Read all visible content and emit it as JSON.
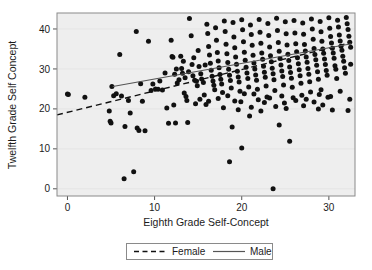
{
  "chart_data": {
    "type": "scatter",
    "title": "",
    "xlabel": "Eighth Grade Self-Concept",
    "ylabel": "Twelfth Grade Self Concept",
    "xlim": [
      -1.2,
      33.0
    ],
    "ylim": [
      -1.8,
      44.0
    ],
    "xticks": [
      0,
      10,
      20,
      30
    ],
    "yticks": [
      0,
      10,
      20,
      30,
      40
    ],
    "xtick_labels": [
      "0",
      "10",
      "20",
      "30"
    ],
    "ytick_labels": [
      "0",
      "10",
      "20",
      "30",
      "40"
    ],
    "grid": true,
    "legend_position": "below-axis-center",
    "marker": "filled-circle",
    "marker_color": "#111111",
    "plot_background": "#eeeeee",
    "legend": [
      {
        "name": "Female",
        "style": "dashed",
        "color": "#111111"
      },
      {
        "name": "Male",
        "style": "solid",
        "color": "#555555"
      }
    ],
    "series": [
      {
        "name": "Female",
        "type": "line",
        "style": "dashed",
        "x": [
          -1.2,
          32.6
        ],
        "y": [
          18.5,
          36.6
        ],
        "slope": 0.536,
        "intercept": 19.14
      },
      {
        "name": "Male",
        "type": "line",
        "style": "solid",
        "x": [
          5.2,
          32.6
        ],
        "y": [
          25.6,
          36.3
        ],
        "slope": 0.39,
        "intercept": 23.57
      }
    ],
    "points": [
      [
        0.0,
        23.7
      ],
      [
        0.1,
        23.6
      ],
      [
        2.0,
        22.9
      ],
      [
        4.8,
        19.5
      ],
      [
        4.9,
        16.9
      ],
      [
        5.0,
        16.5
      ],
      [
        5.1,
        25.6
      ],
      [
        5.3,
        23.3
      ],
      [
        5.6,
        23.8
      ],
      [
        6.0,
        33.6
      ],
      [
        6.2,
        23.2
      ],
      [
        6.5,
        2.5
      ],
      [
        6.6,
        15.6
      ],
      [
        7.0,
        22.1
      ],
      [
        7.2,
        19.0
      ],
      [
        7.6,
        4.3
      ],
      [
        7.9,
        39.4
      ],
      [
        8.0,
        15.2
      ],
      [
        8.2,
        14.6
      ],
      [
        8.4,
        26.3
      ],
      [
        8.6,
        21.9
      ],
      [
        8.9,
        14.5
      ],
      [
        9.3,
        36.9
      ],
      [
        9.6,
        24.6
      ],
      [
        9.8,
        26.2
      ],
      [
        10.1,
        25.0
      ],
      [
        10.4,
        24.9
      ],
      [
        10.6,
        27.0
      ],
      [
        10.9,
        24.7
      ],
      [
        11.2,
        29.0
      ],
      [
        11.4,
        20.2
      ],
      [
        11.6,
        16.4
      ],
      [
        11.9,
        37.2
      ],
      [
        12.0,
        33.1
      ],
      [
        12.1,
        32.9
      ],
      [
        12.2,
        21.0
      ],
      [
        12.3,
        28.7
      ],
      [
        12.4,
        16.5
      ],
      [
        12.6,
        26.5
      ],
      [
        12.8,
        27.3
      ],
      [
        13.0,
        33.2
      ],
      [
        13.1,
        30.1
      ],
      [
        13.2,
        28.9
      ],
      [
        13.4,
        24.0
      ],
      [
        13.5,
        27.8
      ],
      [
        13.6,
        23.1
      ],
      [
        13.8,
        16.6
      ],
      [
        13.9,
        29.3
      ],
      [
        14.0,
        42.6
      ],
      [
        14.2,
        38.3
      ],
      [
        14.3,
        31.1
      ],
      [
        14.4,
        28.3
      ],
      [
        14.6,
        27.2
      ],
      [
        14.8,
        26.9
      ],
      [
        14.9,
        25.8
      ],
      [
        15.0,
        34.6
      ],
      [
        15.1,
        30.6
      ],
      [
        15.3,
        28.8
      ],
      [
        15.4,
        27.5
      ],
      [
        15.6,
        26.6
      ],
      [
        15.7,
        23.5
      ],
      [
        15.9,
        21.1
      ],
      [
        16.0,
        41.2
      ],
      [
        16.1,
        38.9
      ],
      [
        16.2,
        35.6
      ],
      [
        16.3,
        33.5
      ],
      [
        16.4,
        31.4
      ],
      [
        16.5,
        29.7
      ],
      [
        16.6,
        28.2
      ],
      [
        16.7,
        27.0
      ],
      [
        16.8,
        25.9
      ],
      [
        16.9,
        24.8
      ],
      [
        17.0,
        40.3
      ],
      [
        17.1,
        37.2
      ],
      [
        17.2,
        34.1
      ],
      [
        17.3,
        32.0
      ],
      [
        17.4,
        30.3
      ],
      [
        17.5,
        28.6
      ],
      [
        17.6,
        27.4
      ],
      [
        17.7,
        26.2
      ],
      [
        17.8,
        24.1
      ],
      [
        17.9,
        20.3
      ],
      [
        18.0,
        42.0
      ],
      [
        18.1,
        39.4
      ],
      [
        18.2,
        36.2
      ],
      [
        18.3,
        33.8
      ],
      [
        18.4,
        31.6
      ],
      [
        18.5,
        29.9
      ],
      [
        18.6,
        28.4
      ],
      [
        18.7,
        27.1
      ],
      [
        18.8,
        25.2
      ],
      [
        18.9,
        15.5
      ],
      [
        18.6,
        6.8
      ],
      [
        19.0,
        41.6
      ],
      [
        19.1,
        38.0
      ],
      [
        19.2,
        35.3
      ],
      [
        19.3,
        33.0
      ],
      [
        19.4,
        31.2
      ],
      [
        19.5,
        29.4
      ],
      [
        19.6,
        28.0
      ],
      [
        19.7,
        26.7
      ],
      [
        19.8,
        24.4
      ],
      [
        19.9,
        21.8
      ],
      [
        20.0,
        42.3
      ],
      [
        20.1,
        39.8
      ],
      [
        20.2,
        36.8
      ],
      [
        20.3,
        34.2
      ],
      [
        20.4,
        32.2
      ],
      [
        20.5,
        30.4
      ],
      [
        20.6,
        29.0
      ],
      [
        20.7,
        27.6
      ],
      [
        20.8,
        25.5
      ],
      [
        20.9,
        18.2
      ],
      [
        20.0,
        10.2
      ],
      [
        21.0,
        41.0
      ],
      [
        21.1,
        38.6
      ],
      [
        21.2,
        35.9
      ],
      [
        21.3,
        33.4
      ],
      [
        21.4,
        31.5
      ],
      [
        21.5,
        30.0
      ],
      [
        21.6,
        28.5
      ],
      [
        21.7,
        27.2
      ],
      [
        21.8,
        24.9
      ],
      [
        21.9,
        22.3
      ],
      [
        22.0,
        42.4
      ],
      [
        22.1,
        39.2
      ],
      [
        22.2,
        36.4
      ],
      [
        22.3,
        34.0
      ],
      [
        22.4,
        32.4
      ],
      [
        22.5,
        30.7
      ],
      [
        22.6,
        29.2
      ],
      [
        22.7,
        27.9
      ],
      [
        22.8,
        25.7
      ],
      [
        22.9,
        23.0
      ],
      [
        23.0,
        41.4
      ],
      [
        23.1,
        38.4
      ],
      [
        23.2,
        35.5
      ],
      [
        23.3,
        33.3
      ],
      [
        23.4,
        31.8
      ],
      [
        23.5,
        30.2
      ],
      [
        23.6,
        28.8
      ],
      [
        23.7,
        27.3
      ],
      [
        23.8,
        24.6
      ],
      [
        23.9,
        20.6
      ],
      [
        23.6,
        0.0
      ],
      [
        24.0,
        42.7
      ],
      [
        24.1,
        39.6
      ],
      [
        24.2,
        36.6
      ],
      [
        24.3,
        34.4
      ],
      [
        24.4,
        32.6
      ],
      [
        24.5,
        31.0
      ],
      [
        24.6,
        29.5
      ],
      [
        24.7,
        28.1
      ],
      [
        24.8,
        26.0
      ],
      [
        24.9,
        21.5
      ],
      [
        24.3,
        16.0
      ],
      [
        25.0,
        41.8
      ],
      [
        25.1,
        38.8
      ],
      [
        25.2,
        36.0
      ],
      [
        25.3,
        33.7
      ],
      [
        25.4,
        32.1
      ],
      [
        25.5,
        30.5
      ],
      [
        25.6,
        29.1
      ],
      [
        25.7,
        27.7
      ],
      [
        25.8,
        25.4
      ],
      [
        25.9,
        22.8
      ],
      [
        25.5,
        11.9
      ],
      [
        26.0,
        42.1
      ],
      [
        26.1,
        39.0
      ],
      [
        26.2,
        36.3
      ],
      [
        26.3,
        34.3
      ],
      [
        26.4,
        32.8
      ],
      [
        26.5,
        31.3
      ],
      [
        26.6,
        29.8
      ],
      [
        26.7,
        28.3
      ],
      [
        26.8,
        26.4
      ],
      [
        26.9,
        23.4
      ],
      [
        27.0,
        41.5
      ],
      [
        27.1,
        38.7
      ],
      [
        27.2,
        36.1
      ],
      [
        27.3,
        34.5
      ],
      [
        27.4,
        33.0
      ],
      [
        27.5,
        31.7
      ],
      [
        27.6,
        30.1
      ],
      [
        27.7,
        28.7
      ],
      [
        27.8,
        26.8
      ],
      [
        27.9,
        24.2
      ],
      [
        28.0,
        42.5
      ],
      [
        28.1,
        40.0
      ],
      [
        28.2,
        37.4
      ],
      [
        28.3,
        35.1
      ],
      [
        28.4,
        33.6
      ],
      [
        28.5,
        32.3
      ],
      [
        28.6,
        30.9
      ],
      [
        28.7,
        29.3
      ],
      [
        28.8,
        27.4
      ],
      [
        28.9,
        23.6
      ],
      [
        29.0,
        41.9
      ],
      [
        29.1,
        39.3
      ],
      [
        29.2,
        36.9
      ],
      [
        29.3,
        35.0
      ],
      [
        29.4,
        33.9
      ],
      [
        29.5,
        32.5
      ],
      [
        29.6,
        31.1
      ],
      [
        29.7,
        29.6
      ],
      [
        29.8,
        28.4
      ],
      [
        29.9,
        22.9
      ],
      [
        29.3,
        21.0
      ],
      [
        30.0,
        42.8
      ],
      [
        30.1,
        40.2
      ],
      [
        30.2,
        38.1
      ],
      [
        30.3,
        36.5
      ],
      [
        30.4,
        35.2
      ],
      [
        30.5,
        34.0
      ],
      [
        30.6,
        32.7
      ],
      [
        30.7,
        30.8
      ],
      [
        30.8,
        29.9
      ],
      [
        30.9,
        27.6
      ],
      [
        30.4,
        19.7
      ],
      [
        31.0,
        42.2
      ],
      [
        31.1,
        40.5
      ],
      [
        31.2,
        38.5
      ],
      [
        31.3,
        37.0
      ],
      [
        31.4,
        35.7
      ],
      [
        31.5,
        34.7
      ],
      [
        31.6,
        33.2
      ],
      [
        31.7,
        31.9
      ],
      [
        31.8,
        30.3
      ],
      [
        31.9,
        28.9
      ],
      [
        32.0,
        42.9
      ],
      [
        32.1,
        41.3
      ],
      [
        32.2,
        39.9
      ],
      [
        32.3,
        38.2
      ],
      [
        32.4,
        36.7
      ],
      [
        32.5,
        35.4
      ],
      [
        32.5,
        31.2
      ],
      [
        32.4,
        22.4
      ],
      [
        32.2,
        19.6
      ],
      [
        12.5,
        30.0
      ],
      [
        13.3,
        31.9
      ],
      [
        14.5,
        32.8
      ],
      [
        15.8,
        31.0
      ],
      [
        17.3,
        22.6
      ],
      [
        18.4,
        23.3
      ],
      [
        19.2,
        22.0
      ],
      [
        20.3,
        23.8
      ],
      [
        21.4,
        23.7
      ],
      [
        22.6,
        21.6
      ],
      [
        23.2,
        22.7
      ],
      [
        24.6,
        23.2
      ],
      [
        26.2,
        22.1
      ],
      [
        27.4,
        22.4
      ],
      [
        28.3,
        21.7
      ],
      [
        29.1,
        24.8
      ],
      [
        16.2,
        21.9
      ],
      [
        15.2,
        22.4
      ],
      [
        14.7,
        21.3
      ],
      [
        13.7,
        22.1
      ],
      [
        19.6,
        19.8
      ],
      [
        21.1,
        20.4
      ],
      [
        22.2,
        19.5
      ],
      [
        25.1,
        20.1
      ],
      [
        27.1,
        20.8
      ],
      [
        28.8,
        20.0
      ],
      [
        30.2,
        23.1
      ],
      [
        31.3,
        24.4
      ]
    ]
  }
}
